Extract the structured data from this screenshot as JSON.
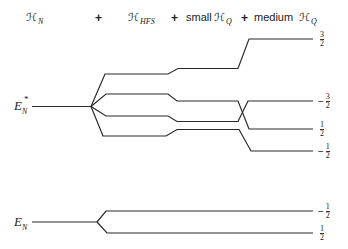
{
  "header": {
    "terms": [
      {
        "symbol": "ℋ",
        "subscript": "N",
        "prefix": ""
      },
      {
        "symbol": "ℋ",
        "subscript": "HFS",
        "prefix": ""
      },
      {
        "symbol": "ℋ",
        "subscript": "Q",
        "prefix": "small"
      },
      {
        "symbol": "ℋ",
        "subscript": "Q",
        "prefix": "medium"
      }
    ],
    "operators": [
      "+",
      "+",
      "+"
    ]
  },
  "levels": {
    "excited": {
      "label": "E",
      "subscript": "N",
      "superscript": "*",
      "sublevels": [
        {
          "m_label": "3/2",
          "sign": "",
          "num": "3",
          "den": "2"
        },
        {
          "m_label": "-3/2",
          "sign": "−",
          "num": "3",
          "den": "2"
        },
        {
          "m_label": "1/2",
          "sign": "",
          "num": "1",
          "den": "2"
        },
        {
          "m_label": "-1/2",
          "sign": "−",
          "num": "1",
          "den": "2"
        }
      ]
    },
    "ground": {
      "label": "E",
      "subscript": "N",
      "sublevels": [
        {
          "m_label": "-1/2",
          "sign": "−",
          "num": "1",
          "den": "2"
        },
        {
          "m_label": "1/2",
          "sign": "",
          "num": "1",
          "den": "2"
        }
      ]
    }
  },
  "style": {
    "line_color": "#2a2a2a",
    "background": "#ffffff"
  }
}
